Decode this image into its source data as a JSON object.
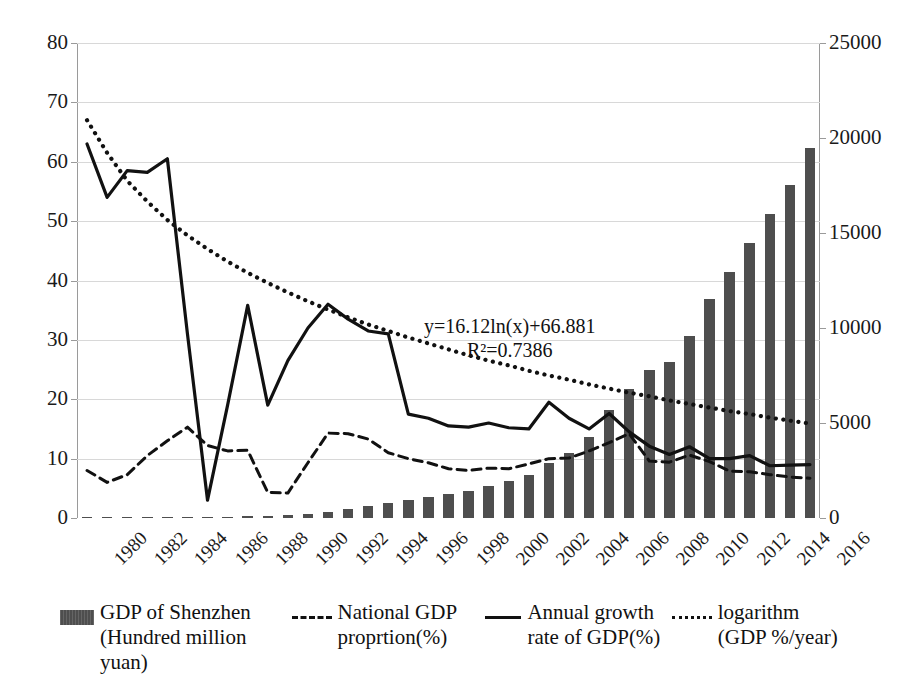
{
  "chart_data": {
    "type": "bar",
    "title": "",
    "xlabel": "",
    "ylabel_left": "",
    "ylabel_right": "",
    "grid": true,
    "legend_position": "bottom",
    "x": [
      1980,
      1981,
      1982,
      1983,
      1984,
      1985,
      1986,
      1987,
      1988,
      1989,
      1990,
      1991,
      1992,
      1993,
      1994,
      1995,
      1996,
      1997,
      1998,
      1999,
      2000,
      2001,
      2002,
      2003,
      2004,
      2005,
      2006,
      2007,
      2008,
      2009,
      2010,
      2011,
      2012,
      2013,
      2014,
      2015,
      2016
    ],
    "categories": [
      "1980",
      "1981",
      "1982",
      "1983",
      "1984",
      "1985",
      "1986",
      "1987",
      "1988",
      "1989",
      "1990",
      "1991",
      "1992",
      "1993",
      "1994",
      "1995",
      "1996",
      "1997",
      "1998",
      "1999",
      "2000",
      "2001",
      "2002",
      "2003",
      "2004",
      "2005",
      "2006",
      "2007",
      "2008",
      "2009",
      "2010",
      "2011",
      "2012",
      "2013",
      "2014",
      "2015",
      "2016"
    ],
    "xtick_labels": [
      "1980",
      "1982",
      "1984",
      "1986",
      "1988",
      "1990",
      "1992",
      "1994",
      "1996",
      "1998",
      "2000",
      "2002",
      "2004",
      "2006",
      "2008",
      "2010",
      "2012",
      "2014",
      "2016"
    ],
    "yaxis_left": {
      "min": 0,
      "max": 80,
      "step": 10,
      "ticks": [
        "0",
        "10",
        "20",
        "30",
        "40",
        "50",
        "60",
        "70",
        "80"
      ]
    },
    "yaxis_right": {
      "min": 0,
      "max": 25000,
      "step": 5000,
      "ticks": [
        "0",
        "5000",
        "10000",
        "15000",
        "20000",
        "25000"
      ]
    },
    "series": [
      {
        "name": "GDP of Shenzhen (Hundred million yuan)",
        "short_name": "GDP of Shenzhen",
        "type": "bar",
        "axis": "right",
        "unit": "Hundred million yuan",
        "color": "#4e4e4e",
        "values": [
          2.7,
          4.0,
          8.0,
          13.0,
          23.0,
          39.0,
          41.0,
          55.0,
          87.0,
          115.0,
          171.7,
          236.7,
          317.3,
          449.3,
          615.0,
          795.7,
          950.0,
          1130.0,
          1289.0,
          1436.5,
          1665.0,
          1954.0,
          2239.0,
          2872.0,
          3422.8,
          4282.1,
          5684.4,
          6801.6,
          7806.5,
          8201.2,
          9581.5,
          11505.5,
          12950.1,
          14500.2,
          16001.8,
          17502.9,
          19492.6
        ]
      },
      {
        "name": "National GDP proprtion(%)",
        "short_name": "National GDP proprtion(%)",
        "type": "line",
        "style": "dashed",
        "axis": "left",
        "unit": "%",
        "color": "#111111",
        "values": [
          8.0,
          6.0,
          7.3,
          10.5,
          13.0,
          15.3,
          12.2,
          11.3,
          11.4,
          4.3,
          4.2,
          9.3,
          14.3,
          14.2,
          13.3,
          11.0,
          10.0,
          9.3,
          8.3,
          8.0,
          8.4,
          8.3,
          9.1,
          10.0,
          10.1,
          11.3,
          12.7,
          14.2,
          9.6,
          9.4,
          10.6,
          9.5,
          7.9,
          7.8,
          7.3,
          6.9,
          6.7
        ]
      },
      {
        "name": "Annual growth rate of GDP(%)",
        "short_name": "Annual growth rate of GDP(%)",
        "type": "line",
        "style": "solid",
        "axis": "left",
        "unit": "%",
        "color": "#111111",
        "values": [
          63.0,
          54.0,
          58.5,
          58.2,
          60.5,
          31.0,
          3.0,
          19.0,
          35.8,
          19.0,
          26.5,
          32.0,
          36.0,
          33.5,
          31.5,
          31.0,
          17.5,
          16.8,
          15.5,
          15.3,
          16.0,
          15.2,
          15.0,
          19.5,
          16.8,
          15.0,
          17.6,
          14.5,
          12.1,
          10.7,
          12.0,
          10.0,
          10.0,
          10.5,
          8.8,
          8.9,
          9.0
        ]
      },
      {
        "name": "logarithm (GDP %/year)",
        "short_name": "logarithm (GDP %/year)",
        "type": "line",
        "style": "dotted",
        "axis": "left",
        "trendline": true,
        "equation": "y=16.12ln(x)+66.881",
        "r_squared": "R²=0.7386",
        "color": "#111111",
        "values": [
          67.0,
          61.5,
          56.8,
          53.3,
          50.2,
          47.6,
          45.3,
          43.2,
          41.3,
          39.6,
          38.0,
          36.5,
          35.1,
          33.8,
          32.6,
          31.5,
          30.4,
          29.4,
          28.4,
          27.4,
          26.5,
          25.7,
          24.8,
          24.0,
          23.3,
          22.5,
          21.8,
          21.1,
          20.5,
          19.8,
          19.2,
          18.6,
          18.0,
          17.5,
          16.9,
          16.4,
          15.9
        ]
      }
    ],
    "annotation": {
      "equation": "y=16.12ln(x)+66.881",
      "r_squared": "R²=0.7386"
    }
  },
  "legend": {
    "items": [
      {
        "swatch": "bar-swatch",
        "label": "GDP of Shenzhen\n(Hundred million\nyuan)"
      },
      {
        "swatch": "dashed-line-swatch",
        "label": "National GDP\nproprtion(%)"
      },
      {
        "swatch": "solid-line-swatch",
        "label": "Annual growth\nrate of GDP(%)"
      },
      {
        "swatch": "dotted-line-swatch",
        "label": "logarithm\n(GDP %/year)"
      }
    ]
  }
}
